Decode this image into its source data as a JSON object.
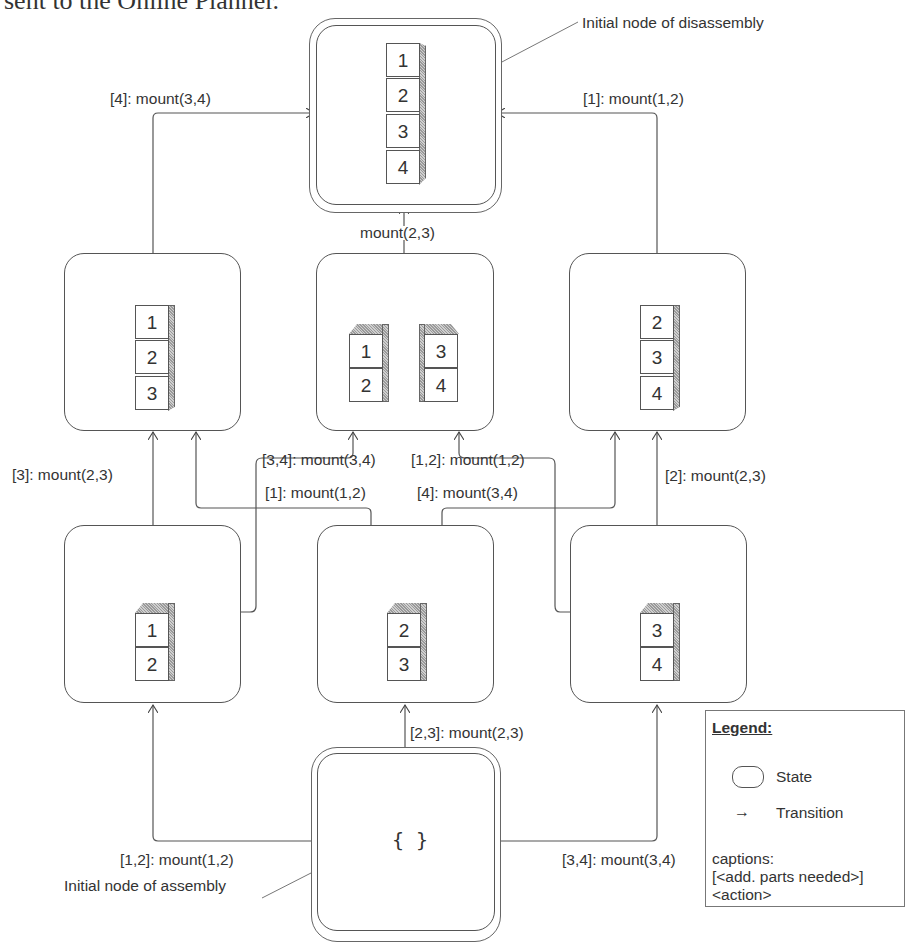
{
  "header": {
    "partial_text": "sent to the Online Planner."
  },
  "annotations": {
    "disassembly": "Initial node of disassembly",
    "assembly": "Initial node of assembly"
  },
  "states": {
    "s1234": {
      "parts": [
        "1",
        "2",
        "3",
        "4"
      ]
    },
    "s123": {
      "parts": [
        "1",
        "2",
        "3"
      ]
    },
    "s12_34": {
      "left": [
        "1",
        "2"
      ],
      "right": [
        "3",
        "4"
      ]
    },
    "s234": {
      "parts": [
        "2",
        "3",
        "4"
      ]
    },
    "s12": {
      "parts": [
        "1",
        "2"
      ]
    },
    "s23": {
      "parts": [
        "2",
        "3"
      ]
    },
    "s34": {
      "parts": [
        "3",
        "4"
      ]
    },
    "empty": {
      "label": "{ }"
    }
  },
  "transitions": {
    "t_123_to_1234": "[4]: mount(3,4)",
    "t_234_to_1234": "[1]: mount(1,2)",
    "t_12_34_to_1234": "mount(2,3)",
    "t_12_to_123": "[3]: mount(2,3)",
    "t_23_to_123": "[1]: mount(1,2)",
    "t_12_to_12_34": "[3,4]: mount(3,4)",
    "t_34_to_12_34": "[1,2]: mount(1,2)",
    "t_23_to_234": "[4]: mount(3,4)",
    "t_34_to_234": "[2]: mount(2,3)",
    "t_empty_to_12": "[1,2]: mount(1,2)",
    "t_empty_to_23": "[2,3]: mount(2,3)",
    "t_empty_to_34": "[3,4]: mount(3,4)"
  },
  "legend": {
    "title": "Legend:",
    "state_label": "State",
    "transition_symbol": "→",
    "transition_label": "Transition",
    "captions_title": "captions:",
    "captions_line1": "[<add. parts needed>]",
    "captions_line2": "<action>"
  }
}
